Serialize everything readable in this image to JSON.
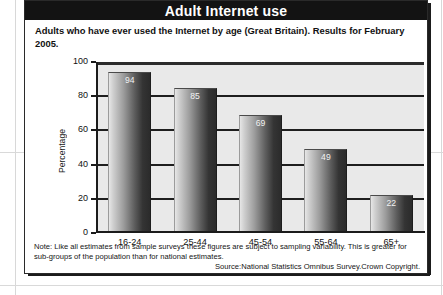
{
  "banner": {
    "title": "Adult Internet use"
  },
  "subtitle": "Adults who have ever used the Internet by age (Great Britain). Results for February 2005.",
  "footnote": "Note: Like all estimates from sample surveys these figures are subject to sampling variability. This is greater for sub-groups of the population than for national estimates.",
  "source": "Source:National Statistics Omnibus Survey.Crown Copyright.",
  "chart_data": {
    "type": "bar",
    "title": "Adults who have ever used the Internet by age (Great Britain). Results for February 2005.",
    "categories": [
      "16-24",
      "25-44",
      "45-54",
      "55-64",
      "65+"
    ],
    "values": [
      94,
      85,
      69,
      49,
      22
    ],
    "xlabel": "",
    "ylabel": "Percentage",
    "ylim": [
      0,
      100
    ],
    "yticks": [
      0,
      20,
      40,
      60,
      80,
      100
    ],
    "ytick_labels": [
      "0",
      "20",
      "40",
      "60",
      "80",
      "100"
    ],
    "grid": true,
    "legend": false,
    "bar_label_color": "#f2f2f2",
    "plot_background": "#e9e9e9",
    "axis_color": "#1b1b1b"
  }
}
